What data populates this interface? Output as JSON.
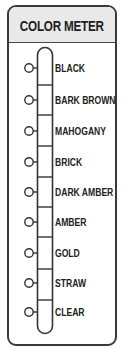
{
  "title": "COLOR METER",
  "levels": [
    {
      "label": "BLACK",
      "y": 68
    },
    {
      "label": "BARK BROWN",
      "y": 100
    },
    {
      "label": "MAHOGANY",
      "y": 131
    },
    {
      "label": "BRICK",
      "y": 162
    },
    {
      "label": "DARK AMBER",
      "y": 192
    },
    {
      "label": "AMBER",
      "y": 222
    },
    {
      "label": "GOLD",
      "y": 253
    },
    {
      "label": "STRAW",
      "y": 283
    },
    {
      "label": "CLEAR",
      "y": 312
    }
  ],
  "colors": {
    "border": "#3a3a3a",
    "header_bg": "#e9e9e9",
    "text": "#222222"
  }
}
